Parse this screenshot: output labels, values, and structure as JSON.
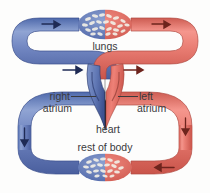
{
  "diagram": {
    "type": "biological-flow-diagram",
    "background_color": "#fdfdfc",
    "colors": {
      "deoxygenated_blood": "#6b84c0",
      "deoxygenated_blood_dark": "#4a5f9e",
      "oxygenated_blood": "#ec7a70",
      "oxygenated_blood_dark": "#c9544a",
      "heart_outline": "#1a1a1a",
      "label_text": "#3a3a3c",
      "capillary_cell": "#f4f1ea"
    },
    "labels": {
      "lungs": "lungs",
      "right_atrium": "right\natrium",
      "right_atrium_line1": "right",
      "right_atrium_line2": "atrium",
      "left_atrium_line1": "left",
      "left_atrium_line2": "atrium",
      "heart": "heart",
      "rest_of_body": "rest of body"
    },
    "structures": [
      {
        "name": "lungs-capillary-bed",
        "label": "lungs",
        "position": "top-center",
        "left_half_color": "#6b84c0",
        "right_half_color": "#ec7a70"
      },
      {
        "name": "body-capillary-bed",
        "label": "rest of body",
        "position": "bottom-center",
        "left_half_color": "#6b84c0",
        "right_half_color": "#ec7a70"
      },
      {
        "name": "heart",
        "label": "heart",
        "position": "center",
        "left_chamber": "right atrium",
        "right_chamber": "left atrium"
      }
    ],
    "flow_arrows": [
      {
        "name": "pulmonary-artery-arrow",
        "direction": "right",
        "color": "#2b3a6b"
      },
      {
        "name": "pulmonary-vein-arrow",
        "direction": "right",
        "color": "#7c2b24"
      },
      {
        "name": "vena-cava-arrow",
        "direction": "down",
        "color": "#2b3a6b"
      },
      {
        "name": "aorta-arrow",
        "direction": "left",
        "color": "#7c2b24"
      },
      {
        "name": "lung-inflow-arrow",
        "direction": "right",
        "color": "#2b3a6b"
      },
      {
        "name": "lung-outflow-arrow",
        "direction": "right",
        "color": "#7c2b24"
      }
    ]
  }
}
